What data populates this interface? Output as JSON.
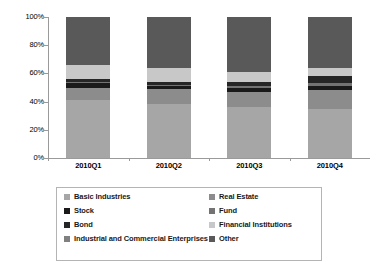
{
  "chart_data": {
    "type": "bar",
    "subtype": "100% stacked column",
    "title": "",
    "xlabel": "",
    "ylabel": "",
    "ylim": [
      0,
      100
    ],
    "ytick_labels": [
      "0%",
      "20%",
      "40%",
      "60%",
      "80%",
      "100%"
    ],
    "ytick_values": [
      0,
      20,
      40,
      60,
      80,
      100
    ],
    "grid": false,
    "legend_position": "bottom",
    "categories": [
      "2010Q1",
      "2010Q2",
      "2010Q3",
      "2010Q4"
    ],
    "series": [
      {
        "name": "Basic Industries",
        "color": "#a6a6a6",
        "values": [
          41,
          38,
          36,
          35
        ]
      },
      {
        "name": "Real Estate",
        "color": "#8c8c8c",
        "values": [
          9,
          11,
          11,
          13
        ]
      },
      {
        "name": "Stock",
        "color": "#1a1a1a",
        "values": [
          3,
          2,
          3,
          3
        ]
      },
      {
        "name": "Fund",
        "color": "#737373",
        "values": [
          1,
          1,
          1,
          2
        ]
      },
      {
        "name": "Bond",
        "color": "#262626",
        "values": [
          2,
          2,
          3,
          5
        ]
      },
      {
        "name": "Financial Institutions",
        "color": "#c8c8c8",
        "values": [
          10,
          10,
          7,
          6
        ]
      },
      {
        "name": "Industrial and Commercial Enterprises",
        "color": "#808080",
        "values": [
          0,
          0,
          0,
          0
        ]
      },
      {
        "name": "Other",
        "color": "#595959",
        "values": [
          34,
          36,
          39,
          36
        ]
      }
    ]
  },
  "axis": {
    "y_ticks": [
      {
        "label": "100%",
        "value": 100
      },
      {
        "label": "80%",
        "value": 80
      },
      {
        "label": "60%",
        "value": 60
      },
      {
        "label": "40%",
        "value": 40
      },
      {
        "label": "20%",
        "value": 20
      },
      {
        "label": "0%",
        "value": 0
      }
    ]
  },
  "legend": {
    "left_column": [
      {
        "label": "Basic Industries",
        "color": "#a6a6a6"
      },
      {
        "label": "Stock",
        "color": "#1a1a1a"
      },
      {
        "label": "Bond",
        "color": "#262626"
      },
      {
        "label": "Industrial and Commercial Enterprises",
        "color": "#808080"
      }
    ],
    "right_column": [
      {
        "label": "Real Estate",
        "color": "#8c8c8c"
      },
      {
        "label": "Fund",
        "color": "#737373"
      },
      {
        "label": "Financial Institutions",
        "color": "#c8c8c8"
      },
      {
        "label": "Other",
        "color": "#595959"
      }
    ]
  }
}
